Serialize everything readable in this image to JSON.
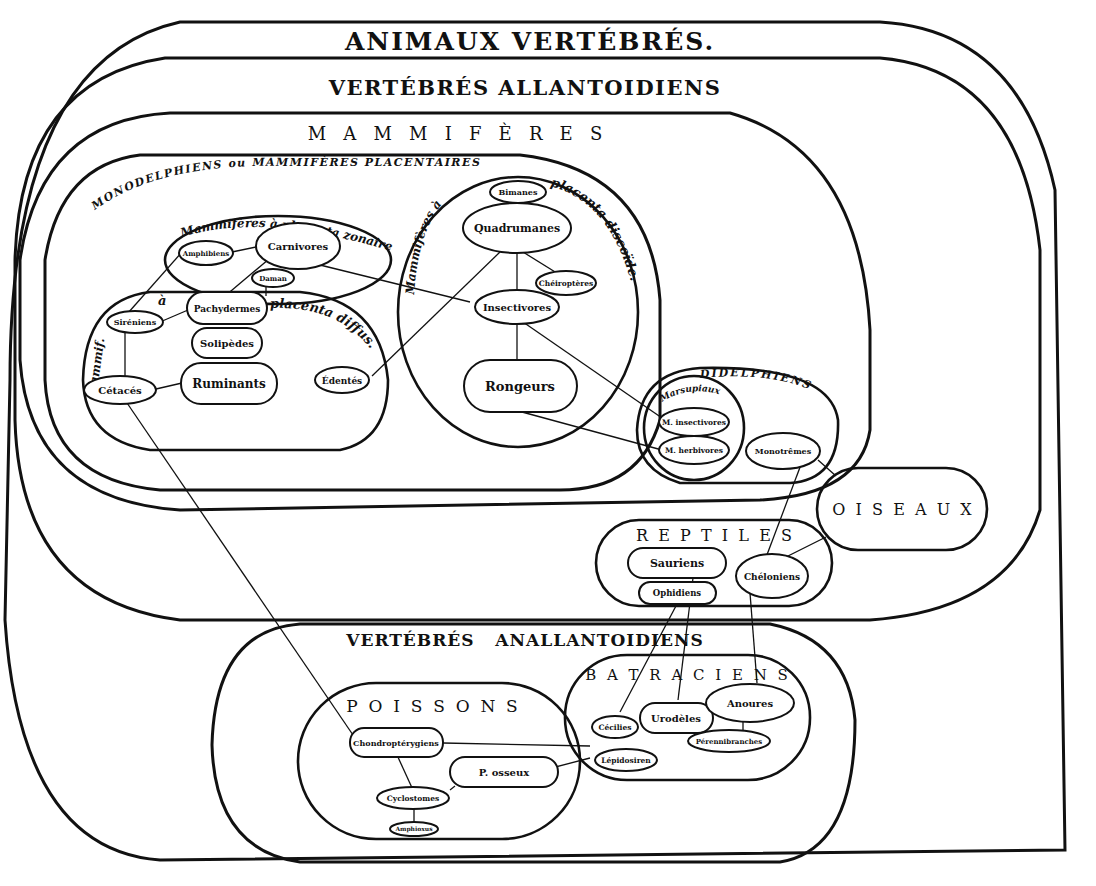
{
  "titles": {
    "animaux_vertebres": "ANIMAUX  VERTÉBRÉS.",
    "vertebres_allantoidiens": "VERTÉBRÉS  ALLANTOIDIENS",
    "mammiferes": "M   A   M   M   I   F   È   R   E   S",
    "monodelphiens": "MONODELPHIENS  ou  MAMMIFÈRES  PLACENTAIRES",
    "placenta_zonaire": "Mammifères à placenta zonaire.",
    "placenta_diffus_a": "à",
    "placenta_diffus": "placenta diffus.",
    "placenta_diffus_left": "Mammif.",
    "placenta_discoide_a": "Mammifères  à",
    "placenta_discoide": "placenta discoïde.",
    "didelphiens": "DIDELPHIENS",
    "marsupiaux": "Marsupiaux",
    "oiseaux": "O  I  S  E  A  U  X",
    "reptiles": "R  E  P  T  I  L  E  S",
    "vertebres_anallantoidiens": "VERTÉBRÉS   ANALLANTOIDIENS",
    "batraciens": "B A T R A C I E N S",
    "poissons": "P  O  I  S  S  O  N  S"
  },
  "nodes": {
    "amphibiens": "Amphibiens",
    "carnivores": "Carnivores",
    "daman": "Daman",
    "sireniens": "Siréniens",
    "pachydermes": "Pachydermes",
    "solipedes": "Solipèdes",
    "ruminants": "Ruminants",
    "cetaces": "Cétacés",
    "edentes": "Édentés",
    "bimanes": "Bimanes",
    "quadrumanes": "Quadrumanes",
    "cheiropteres": "Chéiroptères",
    "insectivores": "Insectivores",
    "rongeurs": "Rongeurs",
    "m_insectivores": "M. insectivores",
    "m_herbivores": "M. herbivores",
    "monotremes": "Monotrêmes",
    "sauriens": "Sauriens",
    "ophidiens": "Ophidiens",
    "cheloniens": "Chéloniens",
    "cecilies": "Cécilies",
    "urodeles": "Urodèles",
    "anoures": "Anoures",
    "perennibranches": "Pérennibranches",
    "lepidosiren": "Lépidosiren",
    "chondropterygiens": "Chondroptérygiens",
    "p_osseux": "P. osseux",
    "cyclostomes": "Cyclostomes",
    "amphioxus": "Amphioxus"
  },
  "links": [
    [
      "amphibiens",
      "carnivores"
    ],
    [
      "amphibiens",
      "sireniens"
    ],
    [
      "carnivores",
      "pachydermes"
    ],
    [
      "carnivores",
      "insectivores"
    ],
    [
      "daman",
      "pachydermes"
    ],
    [
      "sireniens",
      "pachydermes"
    ],
    [
      "sireniens",
      "cetaces"
    ],
    [
      "cetaces",
      "ruminants"
    ],
    [
      "cetaces",
      "chondropterygiens"
    ],
    [
      "edentes",
      "quadrumanes"
    ],
    [
      "bimanes",
      "quadrumanes"
    ],
    [
      "quadrumanes",
      "insectivores"
    ],
    [
      "quadrumanes",
      "cheiropteres"
    ],
    [
      "insectivores",
      "rongeurs"
    ],
    [
      "insectivores",
      "m_insectivores"
    ],
    [
      "rongeurs",
      "m_herbivores"
    ],
    [
      "monotremes",
      "oiseaux"
    ],
    [
      "monotremes",
      "cheloniens"
    ],
    [
      "oiseaux",
      "cheloniens"
    ],
    [
      "ophidiens",
      "cecilies"
    ],
    [
      "sauriens",
      "urodeles"
    ],
    [
      "cheloniens",
      "anoures"
    ],
    [
      "anoures",
      "perennibranches"
    ],
    [
      "chondropterygiens",
      "batraciens"
    ],
    [
      "chondropterygiens",
      "cyclostomes"
    ],
    [
      "p_osseux",
      "lepidosiren"
    ],
    [
      "p_osseux",
      "cyclostomes"
    ],
    [
      "cyclostomes",
      "amphioxus"
    ]
  ]
}
